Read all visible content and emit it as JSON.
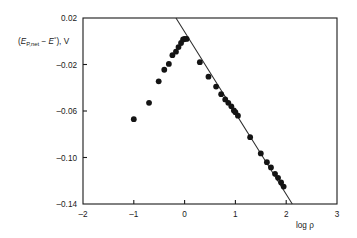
{
  "chart_data": {
    "type": "scatter",
    "title": "",
    "xlabel": "log ρ",
    "ylabel": "(E_{P,net} − E°), V",
    "ylabel_parts": {
      "open_paren": "(",
      "e_main": "E",
      "e_sub": "P,net",
      "minus": " − ",
      "e2_main": "E",
      "e2_sup": "°",
      "close": "), V"
    },
    "xlim": [
      -2,
      3
    ],
    "ylim": [
      -0.14,
      0.02
    ],
    "xticks": [
      -2,
      -1,
      0,
      1,
      2,
      3
    ],
    "xticklabels": [
      "–2",
      "–1",
      "0",
      "1",
      "2",
      "3"
    ],
    "yticks": [
      0.02,
      -0.02,
      -0.06,
      -0.1,
      -0.14
    ],
    "yticklabels": [
      "0.02",
      "–0.02",
      "–0.06",
      "–0.10",
      "–0.14"
    ],
    "grid": false,
    "legend": null,
    "marker": "filled-circle",
    "marker_color": "#141414",
    "marker_radius_px": 2.9,
    "line_color": "#2a2a2a",
    "series": [
      {
        "name": "Peak potential data",
        "points": [
          [
            -1.0,
            -0.067
          ],
          [
            -0.7,
            -0.053
          ],
          [
            -0.51,
            -0.0345
          ],
          [
            -0.4,
            -0.0245
          ],
          [
            -0.31,
            -0.0195
          ],
          [
            -0.24,
            -0.012
          ],
          [
            -0.17,
            -0.009
          ],
          [
            -0.12,
            -0.005
          ],
          [
            -0.07,
            -0.0015
          ],
          [
            -0.03,
            0.0015
          ],
          [
            0.0,
            0.002
          ],
          [
            0.04,
            0.002
          ],
          [
            0.3,
            -0.018
          ],
          [
            0.47,
            -0.0305
          ],
          [
            0.62,
            -0.039
          ],
          [
            0.72,
            -0.0455
          ],
          [
            0.8,
            -0.05
          ],
          [
            0.86,
            -0.053
          ],
          [
            0.92,
            -0.056
          ],
          [
            0.97,
            -0.0595
          ],
          [
            1.0,
            -0.061
          ],
          [
            1.05,
            -0.064
          ],
          [
            1.29,
            -0.0825
          ],
          [
            1.5,
            -0.0965
          ],
          [
            1.62,
            -0.104
          ],
          [
            1.7,
            -0.1085
          ],
          [
            1.78,
            -0.114
          ],
          [
            1.84,
            -0.1175
          ],
          [
            1.9,
            -0.1215
          ],
          [
            1.95,
            -0.125
          ]
        ]
      }
    ],
    "fit_line": {
      "name": "Linear fit",
      "x_start": -0.17,
      "y_start": 0.02,
      "x_end": 2.12,
      "y_end": -0.14,
      "slope": -0.0699,
      "intercept": 0.0081
    }
  }
}
